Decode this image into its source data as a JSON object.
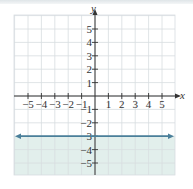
{
  "chart_data": {
    "type": "line",
    "title": "",
    "xlabel": "x",
    "ylabel": "y",
    "xlim": [
      -6,
      6
    ],
    "ylim": [
      -6,
      6
    ],
    "grid": true,
    "x_ticks": [
      -5,
      -4,
      -3,
      -2,
      -1,
      1,
      2,
      3,
      4,
      5
    ],
    "y_ticks": [
      5,
      4,
      3,
      2,
      1,
      -1,
      -2,
      -3,
      -4,
      -5
    ],
    "x_tick_labels": [
      "−5",
      "−4",
      "−3",
      "−2",
      "−1",
      "1",
      "2",
      "3",
      "4",
      "5"
    ],
    "y_tick_labels": [
      "5",
      "4",
      "3",
      "2",
      "1",
      "−1",
      "−2",
      "−3",
      "−4",
      "−5"
    ],
    "series": [
      {
        "name": "boundary line y = -3",
        "style": "solid",
        "x": [
          -6,
          6
        ],
        "y": [
          -3,
          -3
        ],
        "arrows": "both"
      }
    ],
    "shaded_region": {
      "description": "y <= -3",
      "y_from": -6,
      "y_to": -3
    },
    "colors": {
      "line": "#4a7f9a",
      "shade": "#e2efec",
      "grid": "#d8dde0",
      "axis": "#333333"
    }
  }
}
